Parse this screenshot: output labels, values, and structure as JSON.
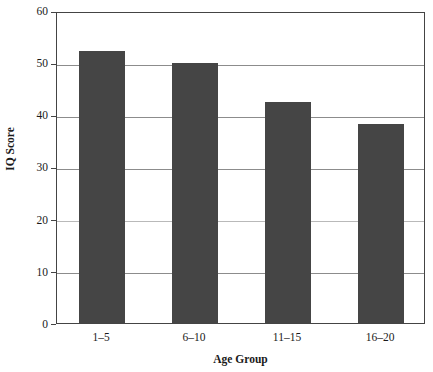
{
  "chart_data": {
    "type": "bar",
    "title": "",
    "subtitle": "",
    "categories": [
      "1–5",
      "6–10",
      "11–15",
      "16–20"
    ],
    "values": [
      52.4,
      50.0,
      42.6,
      38.3
    ],
    "series": [
      {
        "name": "IQ Score",
        "values": [
          52.4,
          50.0,
          42.6,
          38.3
        ]
      }
    ],
    "xlabel": "Age Group",
    "ylabel": "IQ Score",
    "ylim": [
      0,
      60
    ],
    "yticks": [
      0,
      10,
      20,
      30,
      40,
      50,
      60
    ],
    "ytick_labels": [
      "0",
      "10",
      "20",
      "30",
      "40",
      "50",
      "60"
    ],
    "xlim_categories": 4,
    "grid": true,
    "grid_axis": "y",
    "legend": false,
    "legend_position": "none",
    "bar_color": "#454545",
    "frame_color": "#444444",
    "gridline_color": "#8c8c8c",
    "background": "#ffffff",
    "annotations": []
  },
  "axes": {
    "y_title": "IQ Score",
    "x_title": "Age Group"
  }
}
